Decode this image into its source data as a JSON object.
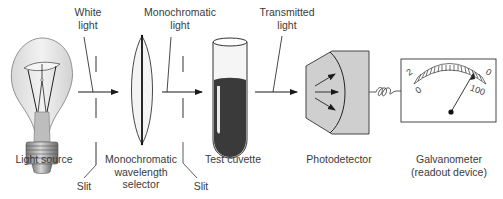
{
  "diagram": {
    "type": "spectrophotometer-schematic",
    "components": [
      {
        "id": "light_source",
        "label": "Light source"
      },
      {
        "id": "slit_1",
        "label": "Slit"
      },
      {
        "id": "wavelength_selector",
        "label_lines": [
          "Monochromatic",
          "wavelength",
          "selector"
        ]
      },
      {
        "id": "slit_2",
        "label": "Slit"
      },
      {
        "id": "cuvette",
        "label": "Test cuvette"
      },
      {
        "id": "photodetector",
        "label": "Photodetector"
      },
      {
        "id": "galvanometer",
        "label_lines": [
          "Galvanometer",
          "(readout device)"
        ]
      }
    ],
    "beams": [
      {
        "id": "white_light",
        "label_lines": [
          "White",
          "light"
        ]
      },
      {
        "id": "mono_light",
        "label_lines": [
          "Monochromatic",
          "light"
        ]
      },
      {
        "id": "transmitted_light",
        "label_lines": [
          "Transmitted",
          "light"
        ]
      }
    ],
    "meter": {
      "scale_top_left": "2",
      "scale_top_right": "0",
      "scale_bottom_left": "0",
      "scale_bottom_right": "100"
    },
    "colors": {
      "line": "#1a1a1a",
      "detector_fill": "#cfcfcf",
      "liquid_fill": "#3a3a3a",
      "bulb_fill": "#e6e6e6"
    }
  }
}
